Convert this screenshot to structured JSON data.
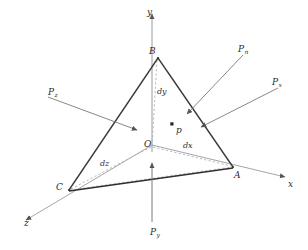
{
  "figure": {
    "background_color": "#ffffff",
    "ink_color": "#2b2b2b",
    "axis_color": "#8c8c8c",
    "dashed_color": "#a8a8a8",
    "arrow_color": "#6f6f6f"
  },
  "axes": [
    {
      "name": "y-axis",
      "label": "y",
      "direction": "up",
      "label_x": 147,
      "label_y": 8
    },
    {
      "name": "x-axis",
      "label": "x",
      "direction": "right-down",
      "label_x": 288,
      "label_y": 180
    },
    {
      "name": "z-axis",
      "label": "z",
      "direction": "left-down",
      "label_x": 24,
      "label_y": 219
    }
  ],
  "origin": {
    "label": "O",
    "label_x": 144,
    "label_y": 140
  },
  "vertices": [
    {
      "name": "vertex-b",
      "label": "B",
      "x": 158,
      "y": 58,
      "label_x": 149,
      "label_y": 47
    },
    {
      "name": "vertex-a",
      "label": "A",
      "x": 233,
      "y": 167,
      "label_x": 234,
      "label_y": 171
    },
    {
      "name": "vertex-c",
      "label": "C",
      "x": 69,
      "y": 190,
      "label_x": 56,
      "label_y": 183
    }
  ],
  "interior_point": {
    "label": "p",
    "x": 172,
    "y": 124,
    "label_x": 176,
    "label_y": 126
  },
  "dimensions": [
    {
      "name": "dimension-dy",
      "label": "dy",
      "label_x": 157,
      "label_y": 88,
      "from": "O",
      "to": "B"
    },
    {
      "name": "dimension-dx",
      "label": "dx",
      "label_x": 183,
      "label_y": 142,
      "from": "O",
      "to": "A"
    },
    {
      "name": "dimension-dz",
      "label": "dz",
      "label_x": 100,
      "label_y": 160,
      "from": "O",
      "to": "C"
    }
  ],
  "forces": [
    {
      "name": "force-pn",
      "base": "P",
      "subscript": "n",
      "label_x": 238,
      "label_y": 45,
      "description": "normal traction on inclined face ABC"
    },
    {
      "name": "force-px",
      "base": "P",
      "subscript": "x",
      "label_x": 272,
      "label_y": 78,
      "description": "traction on face normal to x"
    },
    {
      "name": "force-pz",
      "base": "P",
      "subscript": "z",
      "label_x": 48,
      "label_y": 88,
      "description": "traction on face normal to z"
    },
    {
      "name": "force-py",
      "base": "P",
      "subscript": "y",
      "label_x": 150,
      "label_y": 228,
      "description": "traction on face normal to y"
    }
  ]
}
